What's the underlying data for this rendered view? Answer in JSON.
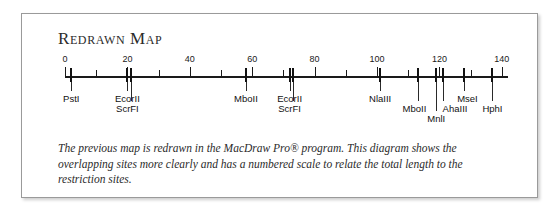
{
  "card": {
    "title": "Redrawn Map",
    "caption": "The previous map is redrawn in the MacDraw Pro® program. This diagram shows the overlapping sites more clearly and has a numbered scale to relate the total length to the restriction sites."
  },
  "chart_data": {
    "type": "table",
    "title": "Redrawn Map",
    "xlabel": "",
    "ylabel": "",
    "axis_min": 0,
    "axis_max": 142,
    "scale_labels": [
      0,
      20,
      40,
      60,
      80,
      100,
      120,
      140
    ],
    "minor_tick_interval": 10,
    "grid": false,
    "legend": "none",
    "categories": [
      "PstI",
      "EcorII",
      "ScrFI",
      "MboII",
      "EcorII",
      "ScrFI",
      "NlaIII",
      "MboII",
      "MnlI",
      "AhaIII",
      "MseI",
      "HphI"
    ],
    "values": [
      2,
      20,
      21,
      58,
      72,
      73,
      101,
      113,
      119,
      121,
      128,
      137
    ],
    "sites": [
      {
        "name": "PstI",
        "position": 2,
        "label_x": 2,
        "label_row": 0
      },
      {
        "name": "EcorII",
        "position": 20,
        "label_x": 20,
        "label_row": 0
      },
      {
        "name": "ScrFI",
        "position": 21,
        "label_x": 20,
        "label_row": 1
      },
      {
        "name": "MboII",
        "position": 58,
        "label_x": 58,
        "label_row": 0
      },
      {
        "name": "EcorII",
        "position": 72,
        "label_x": 72,
        "label_row": 0
      },
      {
        "name": "ScrFI",
        "position": 73,
        "label_x": 72,
        "label_row": 1
      },
      {
        "name": "NlaIII",
        "position": 101,
        "label_x": 101,
        "label_row": 0
      },
      {
        "name": "MboII",
        "position": 113,
        "label_x": 112,
        "label_row": 1
      },
      {
        "name": "MnlI",
        "position": 119,
        "label_x": 119,
        "label_row": 2
      },
      {
        "name": "AhaIII",
        "position": 121,
        "label_x": 125,
        "label_row": 1
      },
      {
        "name": "MseI",
        "position": 128,
        "label_x": 129,
        "label_row": 0
      },
      {
        "name": "HphI",
        "position": 137,
        "label_x": 137,
        "label_row": 1
      }
    ]
  },
  "colors": {
    "border": "#9a9a9a",
    "ink": "#1a1a1a",
    "text": "#2b2b2b"
  }
}
